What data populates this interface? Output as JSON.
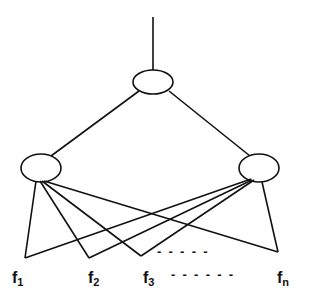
{
  "diagram": {
    "type": "tree",
    "nodes": {
      "root": {
        "label": ""
      },
      "left_child": {
        "label": ""
      },
      "right_child": {
        "label": ""
      }
    },
    "leaves": [
      {
        "base": "f",
        "sub": "1"
      },
      {
        "base": "f",
        "sub": "2"
      },
      {
        "base": "f",
        "sub": "3"
      },
      {
        "base": "f",
        "sub": "n"
      }
    ],
    "ellipsis_upper": "-  -  -  -  -",
    "ellipsis_lower": "-  -  -  -  -  -",
    "colors": {
      "stroke": "#111111",
      "background": "#ffffff"
    }
  }
}
